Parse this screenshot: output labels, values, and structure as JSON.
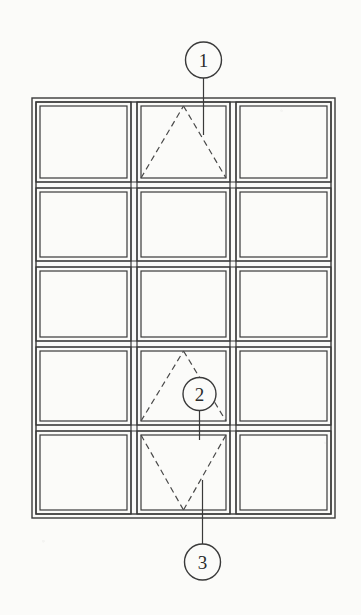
{
  "drawing": {
    "type": "patent-line-drawing",
    "subject": "window-grid-assembly",
    "background_color": "#fbfbf9",
    "line_color": "#3a3a3a",
    "dashed_line_color": "#4a4a4a",
    "canvas": {
      "width": 361,
      "height": 615
    },
    "outer_frame": {
      "name": "outer-frame",
      "x": 32,
      "y": 98,
      "width": 303,
      "height": 420,
      "inner_offset": 4,
      "stroke_width": 1.4
    },
    "grid": {
      "columns": 3,
      "rows": 5,
      "column_edges": [
        36,
        131,
        137,
        230,
        236,
        331
      ],
      "row_edges": [
        102,
        182,
        188,
        261,
        267,
        341,
        347,
        425,
        431,
        514
      ],
      "cell_inset": 4,
      "stroke_width": 1.2
    },
    "sash_symbols": [
      {
        "name": "awning-symbol-top",
        "cell": {
          "row": 1,
          "col": 2
        },
        "shape": "triangle-up",
        "style": "dashed",
        "hinge": "top",
        "label_ref": "1"
      },
      {
        "name": "awning-symbol-middle",
        "cell": {
          "row": 4,
          "col": 2
        },
        "shape": "triangle-up",
        "style": "dashed",
        "hinge": "top",
        "label_ref": "2"
      },
      {
        "name": "hopper-symbol-bottom",
        "cell": {
          "row": 5,
          "col": 2
        },
        "shape": "triangle-down",
        "style": "dashed",
        "hinge": "bottom",
        "label_ref": "3"
      }
    ],
    "callouts": [
      {
        "name": "callout-balloon-1",
        "label": "1",
        "circle": {
          "cx": 203.5,
          "cy": 60,
          "r": 18
        },
        "leader": {
          "x1": 203.5,
          "y1": 78,
          "x2": 203.5,
          "y2": 135
        }
      },
      {
        "name": "callout-balloon-2",
        "label": "2",
        "circle": {
          "cx": 199.5,
          "cy": 394,
          "r": 16.5
        },
        "leader": {
          "x1": 199.5,
          "y1": 410.5,
          "x2": 199.5,
          "y2": 440
        }
      },
      {
        "name": "callout-balloon-3",
        "label": "3",
        "circle": {
          "cx": 202.5,
          "cy": 562,
          "r": 18
        },
        "leader": {
          "x1": 202.5,
          "y1": 544,
          "x2": 202.5,
          "y2": 480
        }
      }
    ]
  }
}
